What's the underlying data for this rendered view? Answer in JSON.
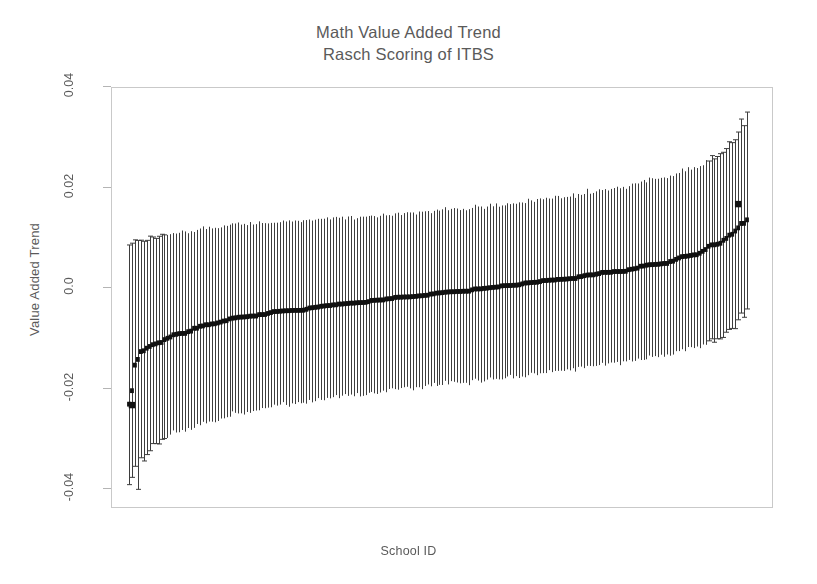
{
  "chart_data": {
    "type": "scatter",
    "variant": "caterpillar-plot-ranked-estimates-with-confidence-intervals",
    "title": "Math Value Added Trend",
    "subtitle": "Rasch Scoring of ITBS",
    "xlabel": "School ID",
    "ylabel": "Value Added Trend",
    "ylim": [
      -0.05,
      0.045
    ],
    "yticks": [
      0.04,
      0.02,
      0.0,
      -0.02,
      -0.04
    ],
    "ytick_labels": [
      "0.04",
      "0.02",
      "0.0",
      "-0.02",
      "-0.04"
    ],
    "xlim": [
      0,
      211
    ],
    "xticks": [],
    "xtick_labels": [],
    "grid": false,
    "legend": null,
    "n_points": 210,
    "point_color": "#111111",
    "errorbar_color": "#3a3a3a",
    "frame_color": "#c9c9c9",
    "text_color": "#5a5a5a",
    "background": "#ffffff",
    "series": [
      {
        "name": "Value added trend estimate",
        "marker": "filled-square",
        "estimate_range": [
          -0.0235,
          0.0165
        ],
        "center_curve_anchors": [
          {
            "index": 1,
            "estimate": -0.0145,
            "ci_low": -0.0405,
            "ci_high": 0.009
          },
          {
            "index": 2,
            "estimate": -0.0235,
            "ci_low": -0.039,
            "ci_high": 0.0086
          },
          {
            "index": 5,
            "estimate": -0.0128,
            "ci_low": -0.0346,
            "ci_high": 0.0094
          },
          {
            "index": 10,
            "estimate": -0.0112,
            "ci_low": -0.031,
            "ci_high": 0.01
          },
          {
            "index": 18,
            "estimate": -0.0093,
            "ci_low": -0.0288,
            "ci_high": 0.0108
          },
          {
            "index": 28,
            "estimate": -0.0074,
            "ci_low": -0.0268,
            "ci_high": 0.0118
          },
          {
            "index": 40,
            "estimate": -0.0059,
            "ci_low": -0.0248,
            "ci_high": 0.0126
          },
          {
            "index": 55,
            "estimate": -0.0046,
            "ci_low": -0.0232,
            "ci_high": 0.0131
          },
          {
            "index": 75,
            "estimate": -0.0033,
            "ci_low": -0.0216,
            "ci_high": 0.0138
          },
          {
            "index": 95,
            "estimate": -0.002,
            "ci_low": -0.0202,
            "ci_high": 0.0146
          },
          {
            "index": 110,
            "estimate": -0.001,
            "ci_low": -0.0192,
            "ci_high": 0.0154
          },
          {
            "index": 125,
            "estimate": 0.0,
            "ci_low": -0.0182,
            "ci_high": 0.0163
          },
          {
            "index": 145,
            "estimate": 0.0014,
            "ci_low": -0.0168,
            "ci_high": 0.0178
          },
          {
            "index": 165,
            "estimate": 0.0029,
            "ci_low": -0.0152,
            "ci_high": 0.0196
          },
          {
            "index": 180,
            "estimate": 0.0045,
            "ci_low": -0.0138,
            "ci_high": 0.0215
          },
          {
            "index": 192,
            "estimate": 0.0064,
            "ci_low": -0.0122,
            "ci_high": 0.0238
          },
          {
            "index": 200,
            "estimate": 0.0086,
            "ci_low": -0.0104,
            "ci_high": 0.0262
          },
          {
            "index": 205,
            "estimate": 0.0105,
            "ci_low": -0.0086,
            "ci_high": 0.0288
          },
          {
            "index": 208,
            "estimate": 0.0125,
            "ci_low": -0.0062,
            "ci_high": 0.0318
          },
          {
            "index": 210,
            "estimate": 0.0132,
            "ci_low": -0.004,
            "ci_high": 0.0348
          }
        ],
        "outliers": [
          {
            "index": 2,
            "estimate": -0.0235,
            "note": "isolated low point separated from the main curve"
          },
          {
            "index": 207,
            "estimate": 0.0165,
            "note": "isolated high point above the main curve"
          }
        ]
      }
    ]
  },
  "figure": {
    "title_line_1": "Math Value Added Trend",
    "title_line_2": "Rasch Scoring of ITBS",
    "ylabel": "Value Added Trend",
    "xlabel": "School ID",
    "ytick_labels": [
      "0.04",
      "0.02",
      "0.0",
      "-0.02",
      "-0.04"
    ]
  }
}
